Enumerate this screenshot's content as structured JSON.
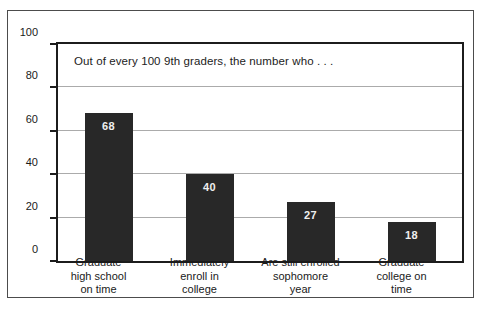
{
  "chart_data": {
    "type": "bar",
    "title": "Out of every 100 9th graders, the number who . . .",
    "categories": [
      "Graduate high school on time",
      "Immediately enroll in college",
      "Are still enrolled sophomore year",
      "Graduate college on time"
    ],
    "category_lines": [
      [
        "Graduate",
        "high school",
        "on time"
      ],
      [
        "Immediately",
        "enroll in",
        "college"
      ],
      [
        "Are still enrolled",
        "sophomore",
        "year"
      ],
      [
        "Graduate",
        "college on",
        "time"
      ]
    ],
    "values": [
      68,
      40,
      27,
      18
    ],
    "value_labels": [
      "68",
      "40",
      "27",
      "18"
    ],
    "ylim": [
      0,
      100
    ],
    "yticks": [
      0,
      20,
      40,
      60,
      80,
      100
    ],
    "ytick_labels": [
      "0",
      "20",
      "40",
      "60",
      "80",
      "100"
    ],
    "xlabel": "",
    "ylabel": "",
    "grid": true,
    "legend_position": "none",
    "colors": {
      "bar": "#282828",
      "bar_label": "#efefef",
      "gridline": "#ababab",
      "plot_frame": "#1c1c1c",
      "outer_border": "#4c4c4c",
      "text": "#1a1a1a",
      "background": "#ffffff"
    }
  }
}
